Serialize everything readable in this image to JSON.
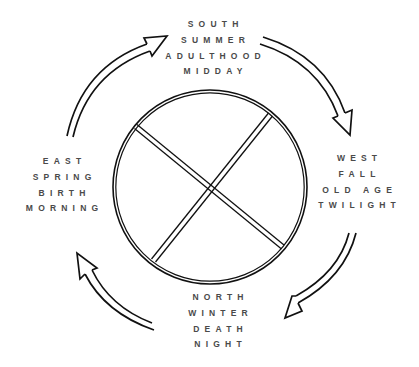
{
  "diagram": {
    "title": "",
    "type": "medicine-wheel-cycle",
    "direction": "clockwise",
    "colors": {
      "line": "#111111",
      "text": "#4a4a4a",
      "background": "#ffffff"
    },
    "center_symbol": {
      "shape": "circle-with-cross",
      "icon": "quartered-circle-icon"
    },
    "quadrants": {
      "south": {
        "position": "top",
        "lines": [
          "SOUTH",
          "SUMMER",
          "ADULTHOOD",
          "MIDDAY"
        ]
      },
      "west": {
        "position": "right",
        "lines": [
          "WEST",
          "FALL",
          "OLD AGE",
          "TWILIGHT"
        ]
      },
      "north": {
        "position": "bottom",
        "lines": [
          "NORTH",
          "WINTER",
          "DEATH",
          "NIGHT"
        ]
      },
      "east": {
        "position": "left",
        "lines": [
          "EAST",
          "SPRING",
          "BIRTH",
          "MORNING"
        ]
      }
    },
    "arrows": [
      {
        "from": "south",
        "to": "west",
        "icon": "curved-arrow-icon"
      },
      {
        "from": "west",
        "to": "north",
        "icon": "curved-arrow-icon"
      },
      {
        "from": "north",
        "to": "east",
        "icon": "curved-arrow-icon"
      },
      {
        "from": "east",
        "to": "south",
        "icon": "curved-arrow-icon"
      }
    ]
  }
}
